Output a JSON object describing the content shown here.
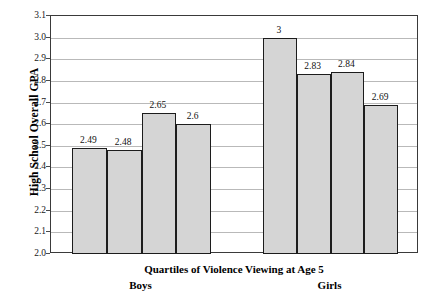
{
  "chart_data": {
    "type": "bar",
    "title": "",
    "xlabel": "Quartiles of Violence Viewing at Age 5",
    "ylabel": "High School Overall GPA",
    "ylim": [
      2.0,
      3.1
    ],
    "ytick_step": 0.1,
    "yticks": [
      "3.1",
      "3.0",
      "2.9",
      "2.8",
      "2.7",
      "2.6",
      "2.5",
      "2.4",
      "2.3",
      "2.2",
      "2.1",
      "2.0"
    ],
    "grid": true,
    "legend": "none",
    "groups": [
      {
        "name": "Boys",
        "label": "Boys",
        "categories": [
          "Q1",
          "Q2",
          "Q3",
          "Q4"
        ],
        "values": [
          2.49,
          2.48,
          2.65,
          2.6
        ],
        "value_labels": [
          "2.49",
          "2.48",
          "2.65",
          "2.6"
        ]
      },
      {
        "name": "Girls",
        "label": "Girls",
        "categories": [
          "Q1",
          "Q2",
          "Q3",
          "Q4"
        ],
        "values": [
          3.0,
          2.83,
          2.84,
          2.69
        ],
        "value_labels": [
          "3",
          "2.83",
          "2.84",
          "2.69"
        ]
      }
    ],
    "series": [
      {
        "name": "High School Overall GPA",
        "categories": [
          "Boys Q1",
          "Boys Q2",
          "Boys Q3",
          "Boys Q4",
          "Girls Q1",
          "Girls Q2",
          "Girls Q3",
          "Girls Q4"
        ],
        "values": [
          2.49,
          2.48,
          2.65,
          2.6,
          3.0,
          2.83,
          2.84,
          2.69
        ]
      }
    ],
    "colors": {
      "bar_fill": "#d5d5d5",
      "bar_border": "#1c1c1c",
      "gridline": "#b9b9b9",
      "frame": "#3a3a3a",
      "text": "#000000"
    }
  }
}
